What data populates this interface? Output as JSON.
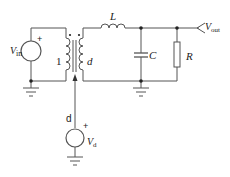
{
  "diagram": {
    "type": "circuit-schematic",
    "components": {
      "input_source": {
        "symbol": "V",
        "subscript": "in",
        "polarity": "+"
      },
      "transformer": {
        "primary_label": "1",
        "secondary_label": "d"
      },
      "inductor": {
        "label": "L"
      },
      "capacitor": {
        "label": "C"
      },
      "resistor": {
        "label": "R"
      },
      "output": {
        "symbol": "V",
        "subscript": "out"
      },
      "control_source": {
        "symbol": "V",
        "subscript": "d",
        "polarity": "+"
      },
      "control_line_label": "d"
    },
    "colors": {
      "wire": "#555555",
      "text": "#222222",
      "background": "#ffffff"
    }
  }
}
